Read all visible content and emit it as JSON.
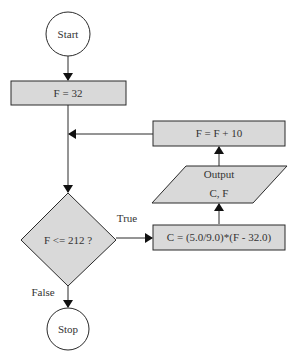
{
  "diagram": {
    "type": "flowchart",
    "colors": {
      "fill": "#d9d9d9",
      "stroke": "#2a2a2a",
      "background": "#ffffff",
      "text": "#333333"
    },
    "nodes": {
      "start": {
        "shape": "circle",
        "label": "Start"
      },
      "init": {
        "shape": "rectangle",
        "label": "F = 32"
      },
      "decision": {
        "shape": "diamond",
        "label": "F <= 212 ?"
      },
      "compute": {
        "shape": "rectangle",
        "label": "C = (5.0/9.0)*(F - 32.0)"
      },
      "output": {
        "shape": "parallelogram",
        "label_line1": "Output",
        "label_line2": "C, F"
      },
      "increment": {
        "shape": "rectangle",
        "label": "F = F + 10"
      },
      "stop": {
        "shape": "circle",
        "label": "Stop"
      }
    },
    "edges": {
      "true_label": "True",
      "false_label": "False"
    }
  }
}
